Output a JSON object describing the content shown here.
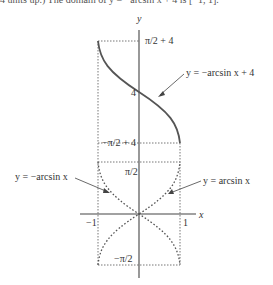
{
  "caption_fragment": "4 units up.) The domain of y = −arcsin x + 4 is [−1, 1].",
  "axes": {
    "x_label": "x",
    "y_label": "y",
    "x_ticks": [
      "−1",
      "1"
    ],
    "y_ticks": [
      "π/2 + 4",
      "4",
      "−π/2 + 4",
      "π/2",
      "−π/2"
    ]
  },
  "annotations": {
    "shifted": "y = −arcsin x + 4",
    "neg_arcsin": "y = −arcsin x",
    "arcsin": "y = arcsin x"
  },
  "colors": {
    "curve": "#555555",
    "axis": "#444444",
    "guide": "#666666"
  }
}
